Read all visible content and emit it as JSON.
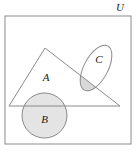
{
  "figure": {
    "type": "venn-diagram",
    "title": "",
    "background_color": "#ffffff",
    "stroke_color": "#8a8a8a",
    "shade_color": "#d9d9d9",
    "label_color": "#1a1a1a"
  },
  "universe": {
    "label": "U",
    "shape": "rectangle",
    "x": 5,
    "y": 16,
    "width": 126,
    "height": 128,
    "label_x": 120,
    "label_y": 11
  },
  "sets": [
    {
      "name": "A",
      "label": "A",
      "shape": "triangle",
      "shaded": false,
      "points": "45,48 120,106 9,106",
      "label_x": 46,
      "label_y": 81
    },
    {
      "name": "B",
      "label": "B",
      "shape": "circle",
      "shaded": true,
      "cx": 44.5,
      "cy": 115.5,
      "r": 22.5,
      "label_x": 44.5,
      "label_y": 123
    },
    {
      "name": "C",
      "label": "C",
      "shape": "ellipse",
      "shaded": false,
      "cx": 96,
      "cy": 68,
      "rx": 12,
      "ry": 25,
      "rotation": 28,
      "label_x": 99,
      "label_y": 63
    }
  ],
  "shaded_regions": [
    {
      "name": "A-intersect-C",
      "description": "intersection of triangle A and ellipse C",
      "fill": "#d9d9d9"
    },
    {
      "name": "B-region",
      "description": "circle B interior",
      "fill": "#e2e2e2"
    }
  ]
}
